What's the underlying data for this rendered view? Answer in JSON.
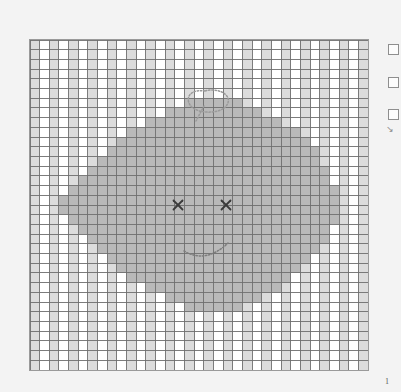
{
  "app": {
    "background_color": "#f3f3f3",
    "width": 401,
    "height": 392
  },
  "canvas": {
    "name": "pixel-grid-canvas",
    "x": 29,
    "y": 39,
    "width": 340,
    "height": 332,
    "columns": 35,
    "rows": 34,
    "cell_size": 9.7,
    "border_color": "#9a9a9a",
    "gridline_color": "#6e6e6e",
    "cell_empty_color": "#ffffff",
    "cell_light_color": "#dcdcdc",
    "cell_shape_color": "#b9b9b9"
  },
  "legend": {
    "checkbox_count": 3,
    "checkboxes": [
      {
        "label": "",
        "checked": false
      },
      {
        "label": "",
        "checked": false
      },
      {
        "label": "",
        "checked": false
      }
    ],
    "tick_glyph": "↘"
  },
  "footer": {
    "page_marker": "1"
  },
  "chart_data": {
    "type": "heatmap",
    "title": "",
    "xlabel": "",
    "ylabel": "",
    "columns": 35,
    "rows": 34,
    "legend_position": "right",
    "grid": true,
    "value_colors": {
      "0": "#ffffff",
      "1": "#dcdcdc",
      "2": "#b9b9b9"
    },
    "checker_pattern": "alternating columns of light (#dcdcdc) and white (#ffffff)",
    "shape": {
      "name": "smiley-face-blob",
      "fill_value": 2,
      "description": "large diamond/round blob centered in grid",
      "center_col": 17,
      "center_row": 17,
      "row_spans": [
        {
          "row": 6,
          "start": 16,
          "end": 21
        },
        {
          "row": 7,
          "start": 14,
          "end": 23
        },
        {
          "row": 8,
          "start": 12,
          "end": 25
        },
        {
          "row": 9,
          "start": 10,
          "end": 27
        },
        {
          "row": 10,
          "start": 9,
          "end": 28
        },
        {
          "row": 11,
          "start": 8,
          "end": 29
        },
        {
          "row": 12,
          "start": 7,
          "end": 29
        },
        {
          "row": 13,
          "start": 6,
          "end": 30
        },
        {
          "row": 14,
          "start": 5,
          "end": 30
        },
        {
          "row": 15,
          "start": 4,
          "end": 31
        },
        {
          "row": 16,
          "start": 3,
          "end": 31
        },
        {
          "row": 17,
          "start": 3,
          "end": 31
        },
        {
          "row": 18,
          "start": 4,
          "end": 31
        },
        {
          "row": 19,
          "start": 5,
          "end": 30
        },
        {
          "row": 20,
          "start": 6,
          "end": 30
        },
        {
          "row": 21,
          "start": 7,
          "end": 29
        },
        {
          "row": 22,
          "start": 8,
          "end": 28
        },
        {
          "row": 23,
          "start": 9,
          "end": 27
        },
        {
          "row": 24,
          "start": 10,
          "end": 26
        },
        {
          "row": 25,
          "start": 12,
          "end": 25
        },
        {
          "row": 26,
          "start": 14,
          "end": 23
        },
        {
          "row": 27,
          "start": 16,
          "end": 21
        }
      ]
    },
    "annotations": [
      {
        "name": "left-eye",
        "type": "x-mark",
        "x": 178,
        "y": 205,
        "size": 9,
        "color": "#3a3a3a"
      },
      {
        "name": "right-eye",
        "type": "x-mark",
        "x": 226,
        "y": 205,
        "size": 9,
        "color": "#3a3a3a"
      },
      {
        "name": "mouth-smile",
        "type": "dotted-curve",
        "color": "#7d7d7d",
        "path": "M 184 251 Q 206 264 228 243"
      },
      {
        "name": "speech-balloon",
        "type": "dotted-outline",
        "color": "#9a9a9a",
        "path": "M 205 91 C 192 89 186 96 189 103 C 192 111 206 114 218 111 C 228 108 231 100 226 95 C 221 90 212 89 205 91 Z M 204 106 L 196 121"
      }
    ]
  }
}
